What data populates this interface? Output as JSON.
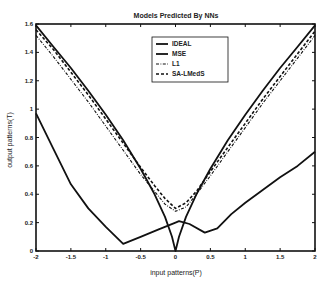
{
  "chart_data": {
    "type": "line",
    "title": "Models Predicted By NNs",
    "xlabel": "input patterns(P)",
    "ylabel": "output patterns(T)",
    "xlim": [
      -2,
      2
    ],
    "ylim": [
      0,
      1.6
    ],
    "grid": false,
    "legend_position": "upper center",
    "x_ticks": [
      -2,
      -1.5,
      -1,
      -0.5,
      0,
      0.5,
      1,
      1.5,
      2
    ],
    "x_tick_labels": [
      "-2",
      "-1.5",
      "-1",
      "-0.5",
      "0",
      "0.5",
      "1",
      "1.5",
      "2"
    ],
    "y_ticks": [
      0,
      0.2,
      0.4,
      0.6,
      0.8,
      1,
      1.2,
      1.4,
      1.6
    ],
    "y_tick_labels": [
      "0",
      "0.2",
      "0.4",
      "0.6",
      "0.8",
      "1",
      "1.2",
      "1.4",
      "1.6"
    ],
    "series": [
      {
        "name": "IDEAL",
        "style": "solid",
        "x": [
          -2,
          -1.75,
          -1.5,
          -1.25,
          -1,
          -0.75,
          -0.5,
          -0.3,
          -0.15,
          -0.05,
          0,
          0.05,
          0.15,
          0.3,
          0.5,
          0.75,
          1,
          1.25,
          1.5,
          1.75,
          2
        ],
        "y": [
          1.59,
          1.44,
          1.29,
          1.13,
          0.96,
          0.78,
          0.58,
          0.4,
          0.24,
          0.1,
          0.0,
          0.1,
          0.24,
          0.4,
          0.58,
          0.78,
          0.96,
          1.13,
          1.29,
          1.44,
          1.59
        ]
      },
      {
        "name": "MSE",
        "style": "solid",
        "x": [
          -2,
          -1.75,
          -1.5,
          -1.25,
          -1,
          -0.75,
          -0.5,
          -0.25,
          0,
          0.05,
          0.2,
          0.42,
          0.6,
          0.8,
          1,
          1.25,
          1.5,
          1.75,
          2
        ],
        "y": [
          0.97,
          0.72,
          0.47,
          0.3,
          0.17,
          0.05,
          0.1,
          0.15,
          0.2,
          0.21,
          0.19,
          0.13,
          0.16,
          0.26,
          0.34,
          0.43,
          0.52,
          0.6,
          0.7
        ]
      },
      {
        "name": "L1",
        "style": "dash-dot",
        "x": [
          -2,
          -1.75,
          -1.5,
          -1.25,
          -1,
          -0.75,
          -0.5,
          -0.3,
          -0.15,
          0,
          0.15,
          0.3,
          0.5,
          0.75,
          1,
          1.25,
          1.5,
          1.75,
          2
        ],
        "y": [
          1.52,
          1.37,
          1.21,
          1.05,
          0.88,
          0.71,
          0.54,
          0.42,
          0.33,
          0.28,
          0.31,
          0.4,
          0.53,
          0.7,
          0.87,
          1.04,
          1.2,
          1.36,
          1.52
        ]
      },
      {
        "name": "SA-LMedS",
        "style": "dashed",
        "x": [
          -2,
          -1.75,
          -1.5,
          -1.25,
          -1,
          -0.75,
          -0.5,
          -0.3,
          -0.15,
          0,
          0.15,
          0.3,
          0.5,
          0.75,
          1,
          1.25,
          1.5,
          1.75,
          2
        ],
        "y": [
          1.56,
          1.42,
          1.26,
          1.1,
          0.93,
          0.76,
          0.59,
          0.46,
          0.37,
          0.3,
          0.34,
          0.42,
          0.56,
          0.73,
          0.9,
          1.07,
          1.23,
          1.39,
          1.55
        ]
      }
    ]
  }
}
